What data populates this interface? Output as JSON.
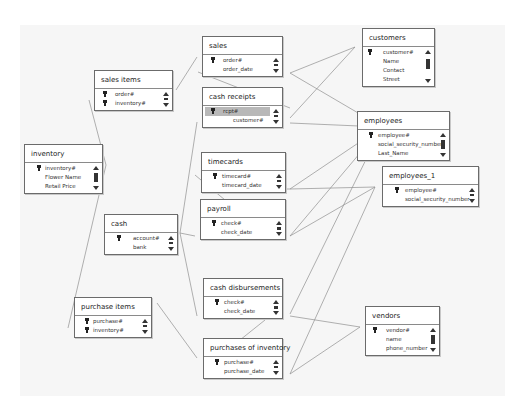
{
  "diagram": {
    "tables": {
      "sales_items": {
        "title": "sales items",
        "fields": [
          "order#",
          "inventory#"
        ],
        "keys": [
          true,
          true
        ]
      },
      "sales": {
        "title": "sales",
        "fields": [
          "order#",
          "order_date"
        ],
        "keys": [
          true,
          false
        ]
      },
      "cash_receipts": {
        "title": "cash receipts",
        "fields": [
          "rcpt#",
          "customer#"
        ],
        "keys": [
          true,
          false
        ],
        "selected_field": "rcpt#"
      },
      "customers": {
        "title": "customers",
        "fields": [
          "customer#",
          "Name",
          "Contact",
          "Street"
        ],
        "keys": [
          true,
          false,
          false,
          false
        ]
      },
      "employees": {
        "title": "employees",
        "fields": [
          "employee#",
          "social_security_number",
          "Last_Name"
        ],
        "keys": [
          true,
          false,
          false
        ]
      },
      "employees_1": {
        "title": "employees_1",
        "fields": [
          "employee#",
          "social_security_number"
        ],
        "keys": [
          true,
          false
        ]
      },
      "inventory": {
        "title": "inventory",
        "fields": [
          "inventory#",
          "Flower Name",
          "Retail Price"
        ],
        "keys": [
          true,
          false,
          false
        ]
      },
      "timecards": {
        "title": "timecards",
        "fields": [
          "timecard#",
          "timecard_date"
        ],
        "keys": [
          true,
          false
        ]
      },
      "payroll": {
        "title": "payroll",
        "fields": [
          "check#",
          "check_date"
        ],
        "keys": [
          true,
          false
        ]
      },
      "cash": {
        "title": "cash",
        "fields": [
          "account#",
          "bank"
        ],
        "keys": [
          true,
          false
        ]
      },
      "cash_disbursements": {
        "title": "cash disbursements",
        "fields": [
          "check#",
          "check_date"
        ],
        "keys": [
          true,
          false
        ]
      },
      "purchase_items": {
        "title": "purchase items",
        "fields": [
          "purchase#",
          "inventory#"
        ],
        "keys": [
          true,
          true
        ]
      },
      "purchases_of_inventory": {
        "title": "purchases of inventory",
        "fields": [
          "purchase#",
          "purchase_date"
        ],
        "keys": [
          true,
          false
        ]
      },
      "vendors": {
        "title": "vendors",
        "fields": [
          "vendor#",
          "name",
          "phone_number"
        ],
        "keys": [
          true,
          false,
          false
        ]
      }
    },
    "colors": {
      "canvas": "#f6f6f6",
      "border": "#6b6b6b",
      "line": "#8a8a8a",
      "selected_row": "#b8b8b8"
    }
  }
}
